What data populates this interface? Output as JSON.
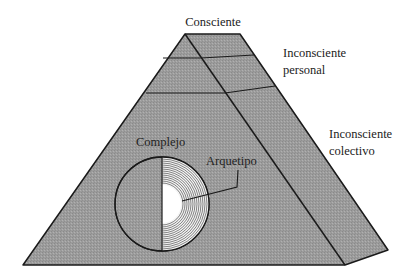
{
  "diagram": {
    "type": "pyramid",
    "title": "",
    "layers": [
      {
        "id": "consciente",
        "label": "Consciente"
      },
      {
        "id": "inconsciente-personal",
        "label_lines": [
          "Inconsciente",
          "personal"
        ]
      },
      {
        "id": "inconsciente-colectivo",
        "label_lines": [
          "Inconsciente",
          "colectivo"
        ]
      }
    ],
    "inner_elements": [
      {
        "id": "complejo",
        "label": "Complejo"
      },
      {
        "id": "arquetipo",
        "label": "Arquetipo"
      }
    ]
  },
  "colors": {
    "pyramid_fill": "#9a9a9a",
    "pyramid_side_fill": "#a3a3a3",
    "line": "#1a1a1a",
    "archetype_core": "#ffffff"
  }
}
